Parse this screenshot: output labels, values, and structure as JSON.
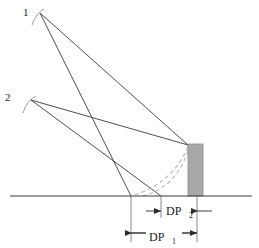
{
  "figure": {
    "background_color": "#ffffff",
    "line_color": "#3a3a3a",
    "dashed_color": "#b0b0b0",
    "wall_fill": "#a8a8a8",
    "wall_stroke": "#8a8a8a",
    "text_color": "#1a1a1a"
  },
  "source_labels": [
    {
      "id": "source-1",
      "text": "1",
      "x": 26,
      "y": 12
    },
    {
      "id": "source-2",
      "text": "2",
      "x": 7,
      "y": 97
    }
  ],
  "sources": [
    {
      "id": "apex-1",
      "x": 40,
      "y": 13
    },
    {
      "id": "apex-2",
      "x": 31,
      "y": 100
    }
  ],
  "rays": [
    {
      "id": "ray-1-ground",
      "x1": 40,
      "y1": 13,
      "x2": 131,
      "y2": 196
    },
    {
      "id": "ray-1-wall",
      "x1": 40,
      "y1": 13,
      "x2": 188,
      "y2": 145
    },
    {
      "id": "ray-2-ground",
      "x1": 31,
      "y1": 100,
      "x2": 161,
      "y2": 196
    },
    {
      "id": "ray-2-wall",
      "x1": 31,
      "y1": 100,
      "x2": 188,
      "y2": 145
    }
  ],
  "ground_line": {
    "x1": 10,
    "y1": 196,
    "x2": 252,
    "y2": 196
  },
  "wall": {
    "x": 188,
    "y": 144,
    "width": 15,
    "height": 52
  },
  "trajectory_curves": [
    {
      "id": "curve-outer",
      "d": "M 188 147 C 178 170 160 188 131 196"
    },
    {
      "id": "curve-inner",
      "d": "M 188 150 C 180 172 166 190 143 196"
    }
  ],
  "dimensions": [
    {
      "id": "dp2",
      "label": "DP",
      "subscript": "2",
      "y": 211,
      "x_start": 131,
      "x_end": 197,
      "arrow_style": "outward",
      "label_x": 164,
      "label_y": 215
    },
    {
      "id": "dp1",
      "label": "DP",
      "subscript": "1",
      "y": 233,
      "x_start": 131,
      "x_end": 197,
      "arrow_style": "inward",
      "label_x": 164,
      "label_y": 240
    }
  ],
  "extension_lines": [
    {
      "id": "ext-left",
      "x": 131,
      "y1": 196,
      "y2": 242
    },
    {
      "id": "ext-mid",
      "x": 161,
      "y1": 196,
      "y2": 218
    },
    {
      "id": "ext-right",
      "x": 197,
      "y1": 196,
      "y2": 242
    }
  ]
}
